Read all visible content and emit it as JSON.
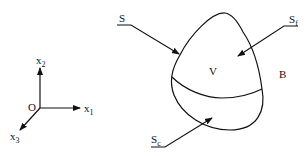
{
  "axes": {
    "origin": "O",
    "x1": {
      "base": "x",
      "sub": "1"
    },
    "x2": {
      "base": "x",
      "sub": "2"
    },
    "x3": {
      "base": "x",
      "sub": "3"
    }
  },
  "body": {
    "volume_label": "V",
    "body_label": "B",
    "surface_label": "S",
    "sf": {
      "base": "S",
      "sub": "f"
    },
    "sc": {
      "base": "S",
      "sub": "c"
    }
  },
  "colors": {
    "ink": "#111111",
    "background": "#ffffff"
  }
}
